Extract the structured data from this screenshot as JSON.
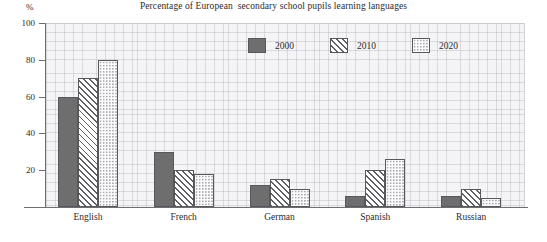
{
  "chart_data": {
    "type": "bar",
    "title": "Percentage of European  secondary school pupils learning languages",
    "xlabel": "",
    "ylabel": "%",
    "ylim": [
      0,
      100
    ],
    "yticks": [
      0,
      20,
      40,
      60,
      80,
      100
    ],
    "ytick_labels": [
      "",
      "20",
      "40",
      "60",
      "80",
      "100"
    ],
    "grid": true,
    "legend_position": "top-center",
    "categories": [
      "English",
      "French",
      "German",
      "Spanish",
      "Russian"
    ],
    "series": [
      {
        "name": "2000",
        "color": "#6e6e6e",
        "pattern": "solid",
        "values": [
          60,
          30,
          12,
          6,
          6
        ]
      },
      {
        "name": "2010",
        "color": "#5f5f63",
        "pattern": "diagonal-hatch",
        "values": [
          70,
          20,
          15,
          20,
          10
        ]
      },
      {
        "name": "2020",
        "color": "#a9a9b0",
        "pattern": "dotted",
        "values": [
          80,
          18,
          10,
          26,
          5
        ]
      }
    ]
  },
  "axis": {
    "unit_label": "%"
  }
}
